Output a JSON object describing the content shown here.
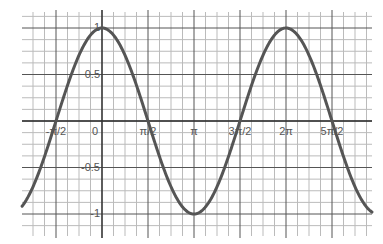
{
  "chart_data": {
    "type": "line",
    "title": "",
    "xlabel": "",
    "ylabel": "",
    "function": "y = cos(x)",
    "series": [
      {
        "name": "cos(x)",
        "color": "#555555",
        "x": [
          -2.73,
          -2.356,
          -1.571,
          -0.785,
          0,
          0.785,
          1.571,
          2.356,
          3.1416,
          3.927,
          4.712,
          5.498,
          6.283,
          7.069,
          7.854,
          8.639,
          9.22
        ],
        "values": [
          -0.92,
          -0.707,
          0,
          0.707,
          1,
          0.707,
          0,
          -0.707,
          -1,
          -0.707,
          0,
          0.707,
          1,
          0.707,
          0,
          -0.707,
          -0.98
        ]
      }
    ],
    "x_ticks": [
      {
        "value": -1.5708,
        "label": "-π/2"
      },
      {
        "value": 0,
        "label": "0"
      },
      {
        "value": 1.5708,
        "label": "π/2"
      },
      {
        "value": 3.1416,
        "label": "π"
      },
      {
        "value": 4.7124,
        "label": "3π/2"
      },
      {
        "value": 6.2832,
        "label": "2π"
      },
      {
        "value": 7.854,
        "label": "5π/2"
      }
    ],
    "y_ticks": [
      {
        "value": 1,
        "label": "1"
      },
      {
        "value": 0.5,
        "label": "0.5"
      },
      {
        "value": -0.5,
        "label": "-0.5"
      },
      {
        "value": -1,
        "label": "-1"
      }
    ],
    "xlim": [
      -2.73,
      9.22
    ],
    "ylim": [
      -1.15,
      1.15
    ],
    "grid": true,
    "legend": "none"
  }
}
